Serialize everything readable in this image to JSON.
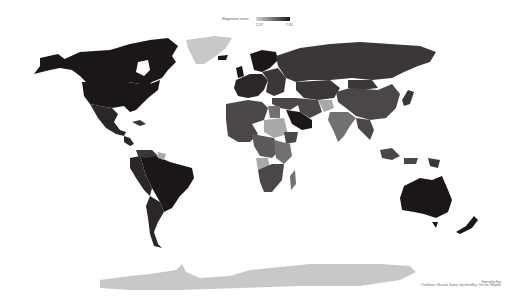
{
  "legend": {
    "title": "Happiness score",
    "min_label": "2.57",
    "max_label": "7.81",
    "min_color": "#d2d2d2",
    "max_color": "#1a161a"
  },
  "attribution": {
    "line1": "Powered by Bing",
    "line2": "© GeoNames, Microsoft, Navteq, OpenStreetMap, TomTom, Wikipedia"
  },
  "map": {
    "type": "filled-choropleth",
    "measure": "Happiness score",
    "range": [
      2.57,
      7.81
    ],
    "colors": {
      "background": "#ffffff",
      "no_data": "#c8c8c8",
      "highest": "#1a161a",
      "high": "#2a262a",
      "upper_mid": "#3a363a",
      "mid": "#4a464a",
      "lower_mid": "#5c585c",
      "low": "#727072",
      "lowest": "#a9a9a9"
    },
    "regions": [
      {
        "name": "Canada",
        "shade": "highest"
      },
      {
        "name": "United States",
        "shade": "highest"
      },
      {
        "name": "Mexico",
        "shade": "high"
      },
      {
        "name": "Greenland",
        "shade": "no_data"
      },
      {
        "name": "Central America",
        "shade": "high"
      },
      {
        "name": "Brazil",
        "shade": "highest"
      },
      {
        "name": "Western South America",
        "shade": "high"
      },
      {
        "name": "Argentina / Chile",
        "shade": "high"
      },
      {
        "name": "Venezuela",
        "shade": "upper_mid"
      },
      {
        "name": "Guyana",
        "shade": "lowest"
      },
      {
        "name": "Nordics",
        "shade": "highest"
      },
      {
        "name": "Western Europe",
        "shade": "high"
      },
      {
        "name": "Eastern Europe",
        "shade": "upper_mid"
      },
      {
        "name": "Russia",
        "shade": "upper_mid"
      },
      {
        "name": "Central Asia",
        "shade": "upper_mid"
      },
      {
        "name": "China",
        "shade": "mid"
      },
      {
        "name": "Mongolia",
        "shade": "upper_mid"
      },
      {
        "name": "Middle East",
        "shade": "mid"
      },
      {
        "name": "Saudi Arabia",
        "shade": "highest"
      },
      {
        "name": "Iran",
        "shade": "mid"
      },
      {
        "name": "Afghanistan",
        "shade": "lowest"
      },
      {
        "name": "India",
        "shade": "low"
      },
      {
        "name": "Southeast Asia",
        "shade": "mid"
      },
      {
        "name": "Japan",
        "shade": "upper_mid"
      },
      {
        "name": "North Africa",
        "shade": "mid"
      },
      {
        "name": "Egypt",
        "shade": "low"
      },
      {
        "name": "Sudan",
        "shade": "lowest"
      },
      {
        "name": "Ethiopia",
        "shade": "mid"
      },
      {
        "name": "West Africa",
        "shade": "mid"
      },
      {
        "name": "Central Africa",
        "shade": "lower_mid"
      },
      {
        "name": "Angola",
        "shade": "lowest"
      },
      {
        "name": "East Africa",
        "shade": "low"
      },
      {
        "name": "Southern Africa",
        "shade": "mid"
      },
      {
        "name": "Madagascar",
        "shade": "low"
      },
      {
        "name": "Indonesia",
        "shade": "mid"
      },
      {
        "name": "Papua New Guinea",
        "shade": "upper_mid"
      },
      {
        "name": "Australia",
        "shade": "highest"
      },
      {
        "name": "New Zealand",
        "shade": "highest"
      },
      {
        "name": "Antarctica",
        "shade": "no_data"
      }
    ]
  }
}
